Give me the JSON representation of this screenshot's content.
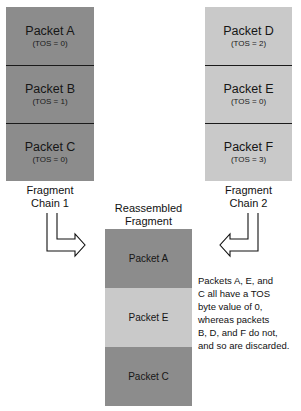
{
  "chains": [
    {
      "label_line1": "Fragment",
      "label_line2": "Chain 1",
      "packets": [
        {
          "name": "Packet A",
          "tos": "(TOS = 0)",
          "shade": "dark"
        },
        {
          "name": "Packet B",
          "tos": "(TOS = 1)",
          "shade": "dark"
        },
        {
          "name": "Packet C",
          "tos": "(TOS = 0)",
          "shade": "dark"
        }
      ]
    },
    {
      "label_line1": "Fragment",
      "label_line2": "Chain 2",
      "packets": [
        {
          "name": "Packet D",
          "tos": "(TOS = 2)",
          "shade": "light"
        },
        {
          "name": "Packet E",
          "tos": "(TOS = 0)",
          "shade": "light"
        },
        {
          "name": "Packet F",
          "tos": "(TOS = 3)",
          "shade": "light"
        }
      ]
    }
  ],
  "reassembled": {
    "label_line1": "Reassembled",
    "label_line2": "Fragment",
    "packets": [
      {
        "name": "Packet A",
        "shade": "dark"
      },
      {
        "name": "Packet E",
        "shade": "light"
      },
      {
        "name": "Packet C",
        "shade": "dark"
      }
    ]
  },
  "note": {
    "lines": [
      "Packets A, E, and",
      "C all have a TOS",
      "byte value of 0,",
      "whereas packets",
      "B, D, and F do not,",
      "and so are discarded."
    ]
  },
  "colors": {
    "dark": "#8c8c8c",
    "light": "#c9c9c9",
    "divider": "#1a1a1a"
  }
}
